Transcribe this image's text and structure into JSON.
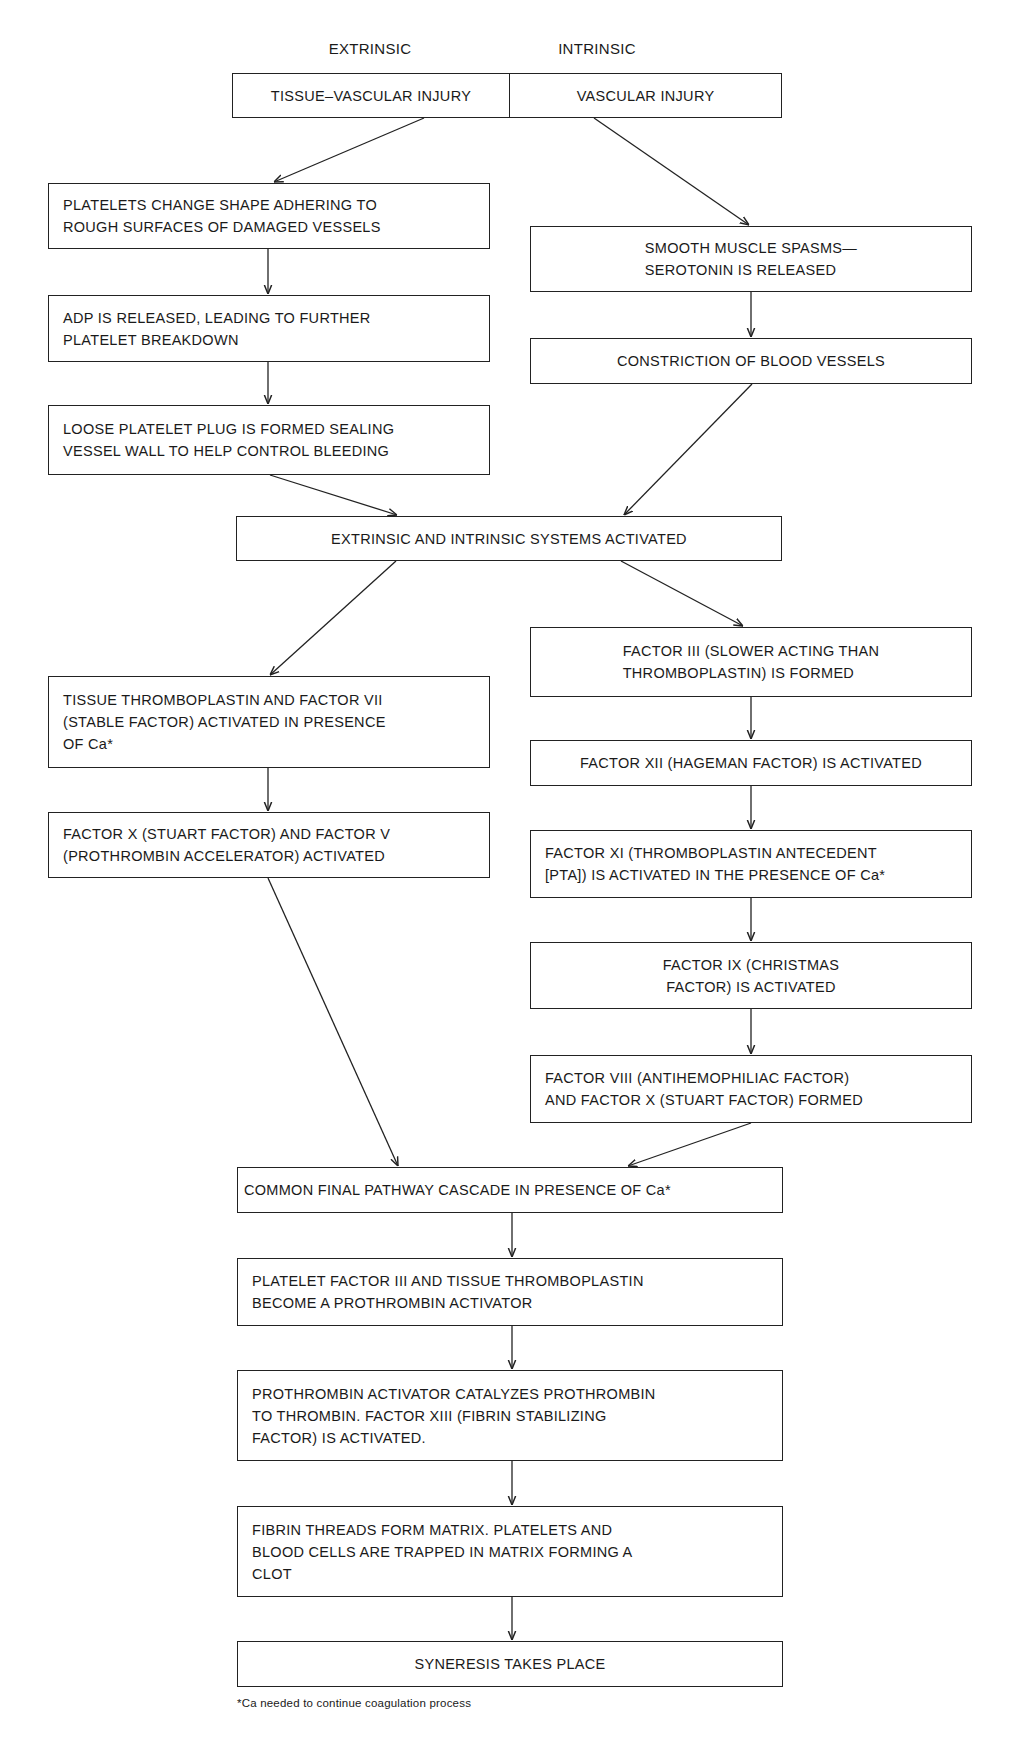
{
  "diagram": {
    "title_cutoff": "",
    "column_labels": {
      "extrinsic": "EXTRINSIC",
      "intrinsic": "INTRINSIC"
    },
    "top_box": {
      "left": "TISSUE–VASCULAR INJURY",
      "right": "VASCULAR INJURY"
    },
    "extrinsic_upper": [
      "PLATELETS CHANGE SHAPE ADHERING TO\nROUGH SURFACES OF DAMAGED VESSELS",
      "ADP IS RELEASED, LEADING TO FURTHER\nPLATELET BREAKDOWN",
      "LOOSE PLATELET PLUG IS FORMED SEALING\nVESSEL WALL TO HELP CONTROL BLEEDING"
    ],
    "intrinsic_upper": [
      "SMOOTH MUSCLE SPASMS—\nSEROTONIN IS RELEASED",
      "CONSTRICTION OF BLOOD VESSELS"
    ],
    "merge_box": "EXTRINSIC AND INTRINSIC SYSTEMS ACTIVATED",
    "extrinsic_lower": [
      "TISSUE THROMBOPLASTIN AND FACTOR VII\n(STABLE FACTOR) ACTIVATED IN PRESENCE\nOF Ca*",
      "FACTOR X (STUART FACTOR) AND FACTOR V\n(PROTHROMBIN ACCELERATOR) ACTIVATED"
    ],
    "intrinsic_lower": [
      "FACTOR III (SLOWER ACTING THAN\nTHROMBOPLASTIN) IS FORMED",
      "FACTOR XII (HAGEMAN FACTOR) IS ACTIVATED",
      "FACTOR XI (THROMBOPLASTIN ANTECEDENT\n[PTA]) IS ACTIVATED IN THE PRESENCE OF Ca*",
      "FACTOR IX (CHRISTMAS\nFACTOR) IS ACTIVATED",
      "FACTOR VIII (ANTIHEMOPHILIAC FACTOR)\nAND FACTOR X (STUART FACTOR) FORMED"
    ],
    "common_pathway": [
      "COMMON FINAL  PATHWAY CASCADE  IN PRESENCE OF Ca*",
      "PLATELET FACTOR III AND TISSUE THROMBOPLASTIN\nBECOME A PROTHROMBIN ACTIVATOR",
      "PROTHROMBIN ACTIVATOR CATALYZES PROTHROMBIN\nTO THROMBIN. FACTOR XIII (FIBRIN STABILIZING\nFACTOR) IS ACTIVATED.",
      "FIBRIN THREADS FORM MATRIX. PLATELETS AND\nBLOOD CELLS ARE TRAPPED IN MATRIX FORMING A\nCLOT",
      "SYNERESIS TAKES PLACE"
    ],
    "footnote": "*Ca needed to continue coagulation process"
  },
  "colors": {
    "line": "#222222",
    "background": "#ffffff",
    "text": "#1a1a1a"
  }
}
